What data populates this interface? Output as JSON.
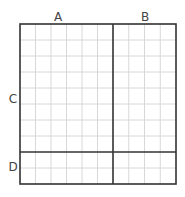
{
  "labels": {
    "top_left": "A",
    "top_right": "B",
    "left_upper": "C",
    "left_lower": "D"
  },
  "grid": {
    "columns_a": 6,
    "columns_b": 4,
    "rows_c": 8,
    "rows_d": 2,
    "border_color": "#333333",
    "gridline_color": "#d8d8d8"
  }
}
